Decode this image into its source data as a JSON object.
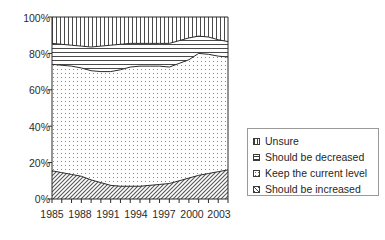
{
  "chart_data": {
    "type": "area",
    "subtype": "stacked-100-percent",
    "title": "",
    "xlabel": "",
    "ylabel": "",
    "ylim": [
      0,
      100
    ],
    "ytick_labels": [
      "0%",
      "20%",
      "40%",
      "60%",
      "80%",
      "100%"
    ],
    "ytick_values": [
      0,
      20,
      40,
      60,
      80,
      100
    ],
    "xtick_labels": [
      "1985",
      "1988",
      "1991",
      "1994",
      "1997",
      "2000",
      "2003"
    ],
    "xtick_values": [
      1985,
      1988,
      1991,
      1994,
      1997,
      2000,
      2003
    ],
    "xlim": [
      1985,
      2003
    ],
    "grid": false,
    "legend_position": "right",
    "x": [
      1985,
      1986,
      1987,
      1988,
      1989,
      1990,
      1991,
      1992,
      1993,
      1994,
      1995,
      1996,
      1997,
      1998,
      1999,
      2000,
      2001,
      2002,
      2003
    ],
    "series": [
      {
        "name": "Should be increased",
        "pattern": "diagonal-hatch",
        "order": 1,
        "values": [
          15.5,
          14.5,
          13.5,
          12.5,
          10.5,
          9.0,
          7.5,
          7.0,
          7.0,
          7.0,
          7.5,
          8.0,
          8.5,
          10.0,
          11.5,
          13.0,
          14.0,
          15.0,
          16.0
        ]
      },
      {
        "name": "Keep the current level",
        "pattern": "dotted-stipple",
        "order": 2,
        "values": [
          58.5,
          59.0,
          59.5,
          59.5,
          60.0,
          61.0,
          62.5,
          64.0,
          65.5,
          66.0,
          65.5,
          65.0,
          64.0,
          64.5,
          65.0,
          67.0,
          65.5,
          63.5,
          62.0
        ]
      },
      {
        "name": "Should be decreased",
        "pattern": "horizontal-lines",
        "order": 3,
        "values": [
          11.5,
          11.5,
          11.5,
          12.0,
          13.0,
          14.0,
          14.5,
          14.0,
          13.0,
          12.5,
          12.5,
          12.5,
          13.0,
          12.5,
          12.0,
          9.5,
          9.5,
          9.0,
          8.5
        ]
      },
      {
        "name": "Unsure",
        "pattern": "vertical-lines",
        "order": 4,
        "values": [
          14.5,
          15.0,
          15.5,
          16.0,
          16.5,
          16.0,
          15.5,
          15.0,
          14.5,
          14.5,
          14.5,
          14.5,
          14.5,
          13.0,
          11.5,
          10.5,
          11.0,
          12.5,
          13.5
        ]
      }
    ],
    "cumulative_upper_boundaries": {
      "should_be_increased": [
        15.5,
        14.5,
        13.5,
        12.5,
        10.5,
        9.0,
        7.5,
        7.0,
        7.0,
        7.0,
        7.5,
        8.0,
        8.5,
        10.0,
        11.5,
        13.0,
        14.0,
        15.0,
        16.0
      ],
      "keep_the_current_level": [
        74.0,
        73.5,
        73.0,
        72.0,
        70.5,
        70.0,
        70.0,
        71.0,
        72.5,
        73.0,
        73.0,
        73.0,
        72.5,
        74.5,
        76.5,
        80.0,
        79.5,
        78.5,
        78.0
      ],
      "should_be_decreased": [
        85.5,
        85.0,
        84.5,
        84.0,
        83.5,
        84.0,
        84.5,
        85.0,
        85.5,
        85.5,
        85.5,
        85.5,
        85.5,
        87.0,
        88.5,
        89.5,
        89.0,
        87.5,
        86.5
      ],
      "unsure": [
        100,
        100,
        100,
        100,
        100,
        100,
        100,
        100,
        100,
        100,
        100,
        100,
        100,
        100,
        100,
        100,
        100,
        100,
        100
      ]
    }
  },
  "legend": {
    "items": [
      {
        "label": "Unsure",
        "pattern": "vertical-lines"
      },
      {
        "label": "Should be decreased",
        "pattern": "horizontal-lines"
      },
      {
        "label": "Keep the current level",
        "pattern": "dotted-stipple"
      },
      {
        "label": "Should be increased",
        "pattern": "diagonal-hatch"
      }
    ]
  },
  "colors": {
    "background": "#ffffff",
    "ink": "#1a1a1a",
    "axis": "#2b2b2b",
    "legend_border": "#9a9a9a"
  }
}
